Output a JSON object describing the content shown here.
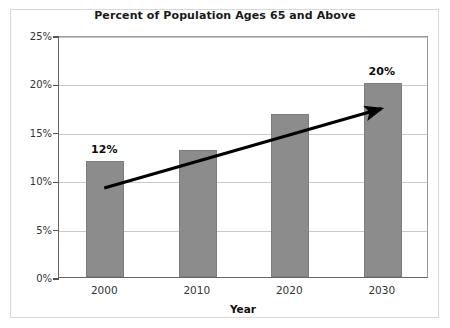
{
  "chart_data": {
    "type": "bar",
    "title": "Percent of Population Ages 65 and Above",
    "xlabel": "Year",
    "ylabel": "Percentage",
    "categories": [
      "2000",
      "2010",
      "2020",
      "2030"
    ],
    "values": [
      12,
      13.1,
      16.8,
      20
    ],
    "ylim": [
      0,
      25
    ],
    "ytick_labels": [
      "0%",
      "5%",
      "10%",
      "15%",
      "20%",
      "25%"
    ],
    "ytick_values": [
      0,
      5,
      10,
      15,
      20,
      25
    ],
    "grid": true,
    "legend": null,
    "bar_color": "#8c8c8c",
    "data_labels": [
      {
        "category": "2000",
        "text": "12%"
      },
      {
        "category": "2030",
        "text": "20%"
      }
    ],
    "annotations": [
      {
        "name": "trend-arrow",
        "type": "arrow",
        "from": {
          "x_year": "2000",
          "y_percent": 9.3
        },
        "to": {
          "x_year": "2030",
          "y_percent": 17.5
        },
        "color": "#000000"
      }
    ]
  }
}
